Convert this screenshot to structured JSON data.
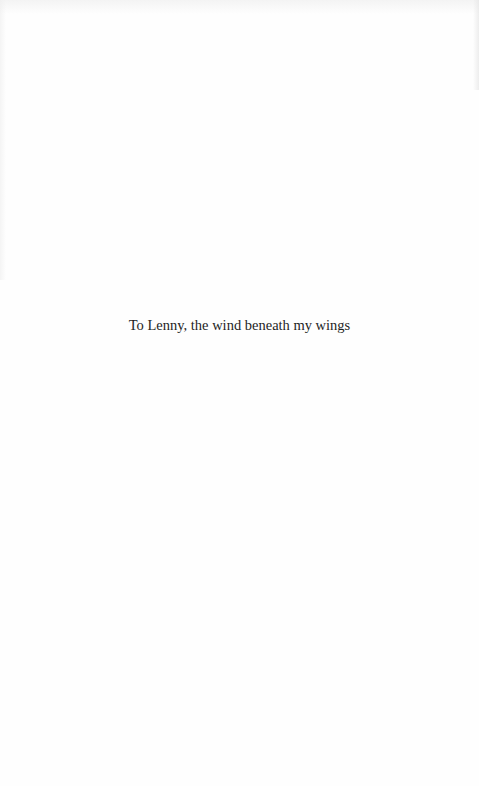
{
  "page": {
    "dedication": "To Lenny, the wind beneath my wings"
  }
}
